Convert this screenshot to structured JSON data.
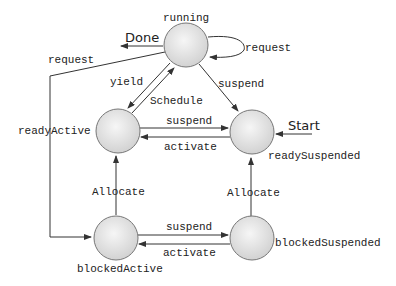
{
  "diagram": {
    "type": "state-machine",
    "states": [
      {
        "id": "running",
        "label": "running"
      },
      {
        "id": "readyActive",
        "label": "readyActive"
      },
      {
        "id": "readySuspended",
        "label": "readySuspended"
      },
      {
        "id": "blockedActive",
        "label": "blockedActive"
      },
      {
        "id": "blockedSuspended",
        "label": "blockedSuspended"
      }
    ],
    "terminals": {
      "start": "Start",
      "done": "Done"
    },
    "transitions": {
      "running_done": "Done",
      "running_request_self": "request",
      "running_request_blocked": "request",
      "running_yield": "yield",
      "ready_schedule": "Schedule",
      "running_suspend": "suspend",
      "ready_suspend": "suspend",
      "ready_activate": "activate",
      "blocked_allocate": "Allocate",
      "blocked_susp_allocate": "Allocate",
      "blocked_suspend": "suspend",
      "blocked_activate": "activate"
    }
  },
  "colors": {
    "circle_fill_center": "#f4f4f4",
    "circle_fill_edge": "#d4d4d4",
    "stroke": "#333333"
  }
}
